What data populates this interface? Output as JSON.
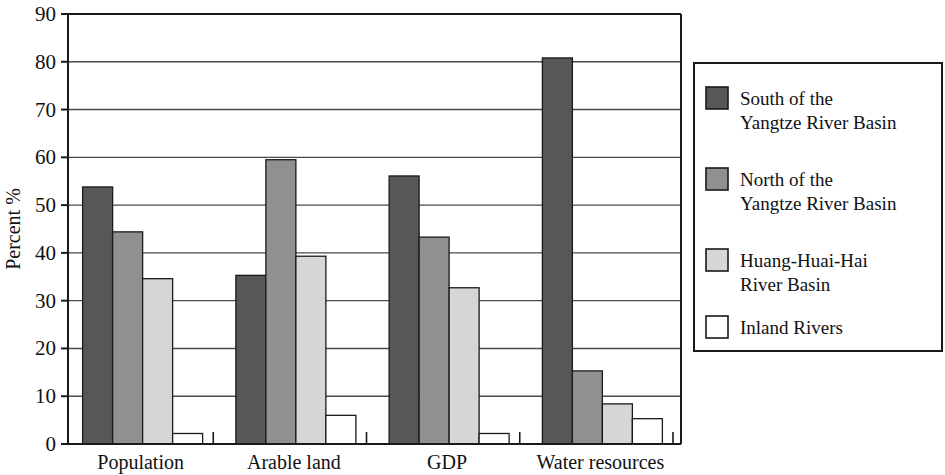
{
  "chart_data": {
    "type": "bar",
    "title": "",
    "xlabel": "",
    "ylabel": "Percent %",
    "ylim": [
      0,
      90
    ],
    "ytick_step": 10,
    "yticks": [
      "0",
      "10",
      "20",
      "30",
      "40",
      "50",
      "60",
      "70",
      "80",
      "90"
    ],
    "grid": true,
    "legend_position": "right",
    "categories": [
      "Population",
      "Arable land",
      "GDP",
      "Water resources"
    ],
    "series": [
      {
        "name": "South of the Yangtze River Basin",
        "label_line1": "South of the",
        "label_line2": "Yangtze River Basin",
        "color": "#575757",
        "values": [
          53.8,
          35.3,
          56.1,
          80.8
        ]
      },
      {
        "name": "North of the Yangtze River Basin",
        "label_line1": "North of the",
        "label_line2": "Yangtze River Basin",
        "color": "#909090",
        "values": [
          44.4,
          59.5,
          43.3,
          15.3
        ]
      },
      {
        "name": "Huang-Huai-Hai River Basin",
        "label_line1": "Huang-Huai-Hai",
        "label_line2": "River Basin",
        "color": "#d6d6d6",
        "values": [
          34.6,
          39.3,
          32.7,
          8.4
        ]
      },
      {
        "name": "Inland Rivers",
        "label_line1": "Inland Rivers",
        "label_line2": "",
        "color": "#ffffff",
        "values": [
          2.2,
          6.0,
          2.2,
          5.3
        ]
      }
    ]
  },
  "axis": {
    "stroke_color": "#1a1a1a",
    "grid_color": "#4a4a4a"
  },
  "legend": {
    "border_color": "#1a1a1a",
    "swatch_border": "#1a1a1a"
  }
}
